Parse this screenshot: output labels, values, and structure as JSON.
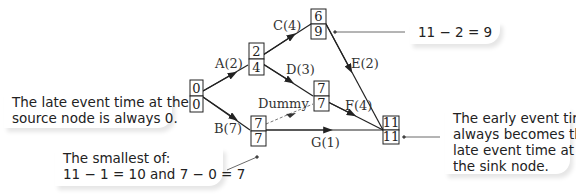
{
  "diagram": {
    "type": "activity network (event times)",
    "nodes": [
      {
        "id": "source",
        "early": "0",
        "late": "0",
        "x": 190,
        "y": 80
      },
      {
        "id": "n2",
        "early": "2",
        "late": "4",
        "x": 248,
        "y": 43
      },
      {
        "id": "n3",
        "early": "6",
        "late": "9",
        "x": 311,
        "y": 9
      },
      {
        "id": "n4",
        "early": "7",
        "late": "7",
        "x": 250,
        "y": 116
      },
      {
        "id": "n5",
        "early": "7",
        "late": "7",
        "x": 313,
        "y": 80
      },
      {
        "id": "sink",
        "early": "11",
        "late": "11",
        "x": 383,
        "y": 116
      }
    ],
    "activities": [
      {
        "label": "A(2)",
        "from": "source",
        "to": "n2"
      },
      {
        "label": "B(7)",
        "from": "source",
        "to": "n4"
      },
      {
        "label": "C(4)",
        "from": "n2",
        "to": "n3"
      },
      {
        "label": "D(3)",
        "from": "n2",
        "to": "n5"
      },
      {
        "label": "E(2)",
        "from": "n3",
        "to": "sink"
      },
      {
        "label": "F(4)",
        "from": "n5",
        "to": "sink"
      },
      {
        "label": "G(1)",
        "from": "n4",
        "to": "sink"
      },
      {
        "label": "Dummy",
        "from": "n4",
        "to": "n5",
        "dashed": true
      }
    ]
  },
  "callouts": {
    "source_note": "The late event time at the\nsource node is always 0.",
    "smallest_note": "The smallest of:\n11 − 1 = 10 and 7 − 0 = 7",
    "n3_note": "11 − 2 = 9",
    "sink_note": "The early event time\nalways becomes the\nlate event time at\nthe sink node."
  }
}
